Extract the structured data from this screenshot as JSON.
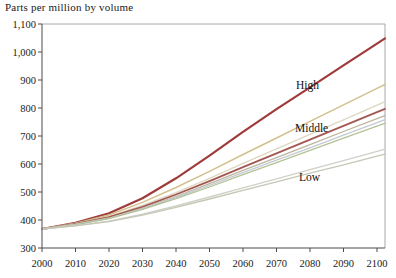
{
  "chart_data": {
    "type": "line",
    "title": "Parts per million by volume",
    "xlabel": "",
    "ylabel": "Parts per million by volume",
    "x": [
      2000,
      2010,
      2020,
      2030,
      2040,
      2050,
      2060,
      2070,
      2080,
      2090,
      2100
    ],
    "x_tick_labels": [
      "2000",
      "2010",
      "2020",
      "2030",
      "2040",
      "2050",
      "2060",
      "2070",
      "2080",
      "2090",
      "2100"
    ],
    "y_ticks": [
      300,
      400,
      500,
      600,
      700,
      800,
      900,
      1000,
      1100
    ],
    "y_tick_labels": [
      "300",
      "400",
      "500",
      "600",
      "700",
      "800",
      "900",
      "1,000",
      "1,100"
    ],
    "xlim": [
      2000,
      2100
    ],
    "ylim": [
      300,
      1100
    ],
    "grid": false,
    "legend_position": "inline-annotations",
    "annotations": [
      {
        "label": "High"
      },
      {
        "label": "Middle"
      },
      {
        "label": "Low"
      }
    ],
    "axis_colors": {
      "main_axes": "#4a4a4a",
      "frame": "#a8a8a8",
      "text": "#1a1a1a"
    },
    "series": [
      {
        "name": "high",
        "color": "#9e3b3b",
        "width": 2.2,
        "values": [
          368,
          390,
          424,
          478,
          549,
          630,
          715,
          796,
          874,
          952,
          1030
        ]
      },
      {
        "name": "unlabeled-1",
        "color": "#d2bf8a",
        "width": 1.4,
        "values": [
          368,
          389,
          418,
          463,
          516,
          574,
          634,
          693,
          752,
          811,
          870
        ]
      },
      {
        "name": "unlabeled-2",
        "color": "#ded8c0",
        "width": 1.4,
        "values": [
          368,
          387,
          412,
          452,
          498,
          549,
          602,
          654,
          706,
          758,
          810
        ]
      },
      {
        "name": "middle",
        "color": "#a35852",
        "width": 1.8,
        "values": [
          368,
          386,
          410,
          447,
          491,
          539,
          589,
          638,
          687,
          736,
          785
        ]
      },
      {
        "name": "unlabeled-3",
        "color": "#bcb49e",
        "width": 1.3,
        "values": [
          368,
          385,
          407,
          443,
          484,
          530,
          577,
          623,
          669,
          716,
          762
        ]
      },
      {
        "name": "unlabeled-4",
        "color": "#c3cad1",
        "width": 1.3,
        "values": [
          368,
          384,
          406,
          440,
          480,
          524,
          569,
          614,
          658,
          703,
          748
        ]
      },
      {
        "name": "unlabeled-5",
        "color": "#b3c295",
        "width": 1.3,
        "values": [
          368,
          383,
          405,
          438,
          476,
          518,
          562,
          605,
          649,
          692,
          735
        ]
      },
      {
        "name": "low-1",
        "color": "#d0d0c8",
        "width": 1.3,
        "values": [
          368,
          380,
          396,
          421,
          450,
          482,
          515,
          547,
          580,
          612,
          645
        ]
      },
      {
        "name": "low-2",
        "color": "#c2c8b4",
        "width": 1.3,
        "values": [
          368,
          379,
          394,
          417,
          445,
          475,
          506,
          536,
          567,
          597,
          628
        ]
      }
    ]
  }
}
